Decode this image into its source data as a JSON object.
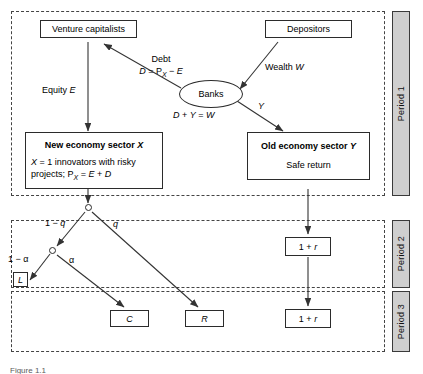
{
  "figure": {
    "caption": "Figure 1.1",
    "periods": [
      {
        "name": "period-1",
        "label": "Period 1"
      },
      {
        "name": "period-2",
        "label": "Period 2"
      },
      {
        "name": "period-3",
        "label": "Period 3"
      }
    ]
  },
  "nodes": {
    "venture_capitalists": {
      "label": "Venture capitalists"
    },
    "depositors": {
      "label": "Depositors"
    },
    "banks": {
      "label": "Banks"
    },
    "new_economy": {
      "title": "New economy sector X",
      "subtitle_line1": "X = 1 innovators with risky",
      "subtitle_line2": "projects; PX = E + D"
    },
    "old_economy": {
      "title": "Old economy sector Y",
      "subtitle": "Safe return"
    },
    "loss_L": {
      "label": "L"
    },
    "outcome_C": {
      "label": "C"
    },
    "outcome_R": {
      "label": "R"
    },
    "return_p2": {
      "label": "1 + r"
    },
    "return_p3": {
      "label": "1 + r"
    }
  },
  "edge_labels": {
    "equity": "Equity E",
    "debt_title": "Debt",
    "debt_formula": "D = PX − E",
    "wealth": "Wealth W",
    "balance": "D + Y = W",
    "y_flow": "Y",
    "prob_one_minus_q": "1 − q",
    "prob_q": "q",
    "prob_one_minus_alpha": "1 − α",
    "prob_alpha": "α"
  },
  "colors": {
    "band_border": "#444444",
    "box_border": "#2b2b2b",
    "tab_fill": "#cfcfcf",
    "line": "#333333",
    "text": "#000000"
  }
}
